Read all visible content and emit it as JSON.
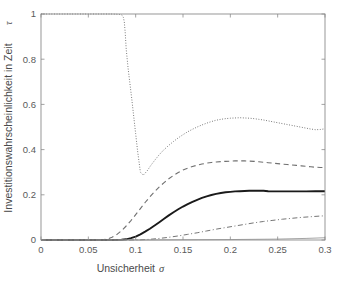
{
  "chart_data": {
    "type": "line",
    "title": "",
    "xlabel": "Unsicherheit",
    "xlabel_symbol": "σ",
    "ylabel": "Investitionswahrscheinlichkeit in Zeit",
    "ylabel_symbol": "τ",
    "xlim": [
      0,
      0.3
    ],
    "ylim": [
      0,
      1
    ],
    "xticks": [
      0,
      0.05,
      0.1,
      0.15,
      0.2,
      0.25,
      0.3
    ],
    "xticklabels": [
      "0",
      "0.05",
      "0.1",
      "0.15",
      "0.2",
      "0.25",
      "0.3"
    ],
    "yticks": [
      0,
      0.2,
      0.4,
      0.6,
      0.8,
      1
    ],
    "yticklabels": [
      "0",
      "0.2",
      "0.4",
      "0.6",
      "0.8",
      "1"
    ],
    "grid": false,
    "legend": "none",
    "background": "#ffffff",
    "axis_color": "#8c8c8c",
    "series": [
      {
        "name": "dotted-upper",
        "style": "dotted",
        "color": "#6e6e6e",
        "width": 1.0,
        "dash": "0.9,1.7",
        "x": [
          0.0,
          0.01,
          0.02,
          0.03,
          0.04,
          0.05,
          0.06,
          0.07,
          0.075,
          0.08,
          0.083,
          0.085,
          0.086,
          0.087,
          0.088,
          0.089,
          0.09,
          0.092,
          0.094,
          0.096,
          0.098,
          0.1,
          0.102,
          0.105,
          0.108,
          0.112,
          0.116,
          0.12,
          0.125,
          0.13,
          0.135,
          0.14,
          0.145,
          0.15,
          0.155,
          0.16,
          0.165,
          0.17,
          0.175,
          0.18,
          0.185,
          0.19,
          0.195,
          0.2,
          0.205,
          0.21,
          0.215,
          0.22,
          0.225,
          0.23,
          0.235,
          0.24,
          0.245,
          0.25,
          0.255,
          0.26,
          0.265,
          0.27,
          0.275,
          0.28,
          0.285,
          0.29,
          0.295,
          0.3
        ],
        "y": [
          1.0,
          1.0,
          1.0,
          1.0,
          1.0,
          1.0,
          1.0,
          1.0,
          1.0,
          0.999,
          0.998,
          0.996,
          0.993,
          0.985,
          0.965,
          0.915,
          0.845,
          0.76,
          0.69,
          0.62,
          0.545,
          0.47,
          0.395,
          0.3,
          0.287,
          0.305,
          0.33,
          0.352,
          0.378,
          0.4,
          0.419,
          0.436,
          0.452,
          0.466,
          0.479,
          0.49,
          0.5,
          0.509,
          0.517,
          0.524,
          0.53,
          0.534,
          0.537,
          0.539,
          0.54,
          0.541,
          0.54,
          0.539,
          0.537,
          0.534,
          0.531,
          0.527,
          0.523,
          0.519,
          0.515,
          0.511,
          0.507,
          0.503,
          0.499,
          0.495,
          0.491,
          0.488,
          0.489,
          0.492
        ]
      },
      {
        "name": "dashed-second",
        "style": "dashed",
        "color": "#707070",
        "width": 1.1,
        "dash": "5,3.5",
        "x": [
          0.0,
          0.02,
          0.04,
          0.055,
          0.065,
          0.07,
          0.075,
          0.08,
          0.085,
          0.09,
          0.095,
          0.1,
          0.105,
          0.11,
          0.115,
          0.12,
          0.125,
          0.13,
          0.135,
          0.14,
          0.145,
          0.15,
          0.155,
          0.16,
          0.165,
          0.17,
          0.175,
          0.18,
          0.185,
          0.19,
          0.195,
          0.2,
          0.205,
          0.21,
          0.215,
          0.22,
          0.225,
          0.23,
          0.235,
          0.24,
          0.245,
          0.25,
          0.255,
          0.26,
          0.265,
          0.27,
          0.275,
          0.28,
          0.285,
          0.29,
          0.295,
          0.3
        ],
        "y": [
          0.0,
          0.0,
          0.0,
          0.0,
          0.001,
          0.004,
          0.012,
          0.024,
          0.041,
          0.062,
          0.086,
          0.112,
          0.139,
          0.166,
          0.191,
          0.214,
          0.235,
          0.254,
          0.271,
          0.286,
          0.299,
          0.31,
          0.318,
          0.325,
          0.331,
          0.336,
          0.34,
          0.343,
          0.345,
          0.347,
          0.348,
          0.349,
          0.35,
          0.35,
          0.35,
          0.349,
          0.348,
          0.346,
          0.344,
          0.342,
          0.34,
          0.338,
          0.336,
          0.334,
          0.332,
          0.33,
          0.328,
          0.326,
          0.324,
          0.322,
          0.321,
          0.32
        ]
      },
      {
        "name": "solid-thick",
        "style": "solid",
        "color": "#1a1a1a",
        "width": 1.9,
        "dash": "none",
        "x": [
          0.0,
          0.02,
          0.04,
          0.06,
          0.075,
          0.085,
          0.09,
          0.095,
          0.1,
          0.105,
          0.11,
          0.115,
          0.12,
          0.125,
          0.13,
          0.135,
          0.14,
          0.145,
          0.15,
          0.155,
          0.16,
          0.165,
          0.17,
          0.175,
          0.18,
          0.185,
          0.19,
          0.195,
          0.2,
          0.205,
          0.21,
          0.215,
          0.22,
          0.225,
          0.23,
          0.235,
          0.24,
          0.25,
          0.26,
          0.27,
          0.28,
          0.29,
          0.3
        ],
        "y": [
          0.0,
          0.0,
          0.0,
          0.0,
          0.0,
          0.001,
          0.003,
          0.008,
          0.015,
          0.025,
          0.037,
          0.05,
          0.064,
          0.079,
          0.094,
          0.109,
          0.123,
          0.136,
          0.148,
          0.159,
          0.169,
          0.178,
          0.186,
          0.193,
          0.199,
          0.204,
          0.208,
          0.211,
          0.213,
          0.215,
          0.216,
          0.217,
          0.218,
          0.218,
          0.218,
          0.218,
          0.216,
          0.215,
          0.215,
          0.215,
          0.215,
          0.216,
          0.216
        ]
      },
      {
        "name": "dashdot-lower",
        "style": "dashdot",
        "color": "#757575",
        "width": 1.0,
        "dash": "5,2.5,1,2.5",
        "x": [
          0.0,
          0.03,
          0.06,
          0.09,
          0.105,
          0.115,
          0.125,
          0.135,
          0.145,
          0.155,
          0.165,
          0.175,
          0.185,
          0.195,
          0.205,
          0.215,
          0.225,
          0.235,
          0.245,
          0.255,
          0.265,
          0.275,
          0.285,
          0.295,
          0.3
        ],
        "y": [
          0.0,
          0.0,
          0.0,
          0.0,
          0.001,
          0.003,
          0.007,
          0.012,
          0.018,
          0.025,
          0.032,
          0.04,
          0.048,
          0.055,
          0.062,
          0.069,
          0.076,
          0.082,
          0.087,
          0.092,
          0.096,
          0.1,
          0.103,
          0.106,
          0.107
        ]
      },
      {
        "name": "flat-baseline",
        "style": "solid",
        "color": "#9a9a9a",
        "width": 0.9,
        "dash": "none",
        "x": [
          0.0,
          0.1,
          0.15,
          0.2,
          0.25,
          0.28,
          0.3
        ],
        "y": [
          0.0,
          0.0,
          0.001,
          0.002,
          0.004,
          0.007,
          0.01
        ]
      }
    ]
  }
}
